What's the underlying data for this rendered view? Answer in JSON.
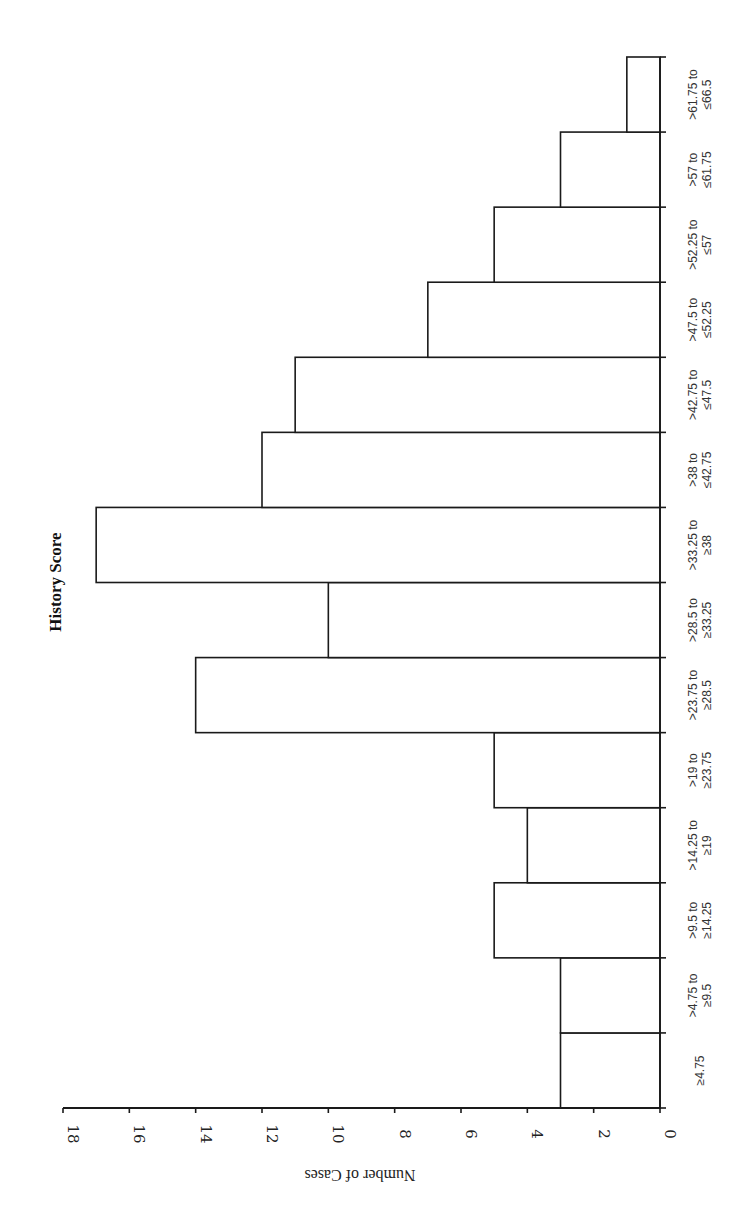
{
  "chart_data": {
    "type": "bar",
    "orientation": "rotated-90-clockwise",
    "title": "History Score",
    "xlabel": "",
    "ylabel": "Number of Cases",
    "ylim": [
      0,
      18
    ],
    "yticks": [
      0,
      2,
      4,
      6,
      8,
      10,
      12,
      14,
      16,
      18
    ],
    "grid": false,
    "legend": null,
    "categories": [
      [
        "≥4.75"
      ],
      [
        ">4.75 to",
        "≥9.5"
      ],
      [
        ">9.5 to",
        "≥14.25"
      ],
      [
        ">14.25 to",
        "≥19"
      ],
      [
        ">19 to",
        "≥23.75"
      ],
      [
        ">23.75 to",
        "≥28.5"
      ],
      [
        ">28.5 to",
        "≥33.25"
      ],
      [
        ">33.25 to",
        "≥38"
      ],
      [
        ">38 to",
        "≤42.75"
      ],
      [
        ">42.75 to",
        "≤47.5"
      ],
      [
        ">47.5 to",
        "≤52.25"
      ],
      [
        ">52.25 to",
        "≤57"
      ],
      [
        ">57 to",
        "≤61.75"
      ],
      [
        ">61.75 to",
        "≤66.5"
      ]
    ],
    "values": [
      3,
      3,
      5,
      4,
      5,
      14,
      10,
      17,
      12,
      11,
      7,
      5,
      3,
      1
    ]
  },
  "labels": {
    "title": "History Score",
    "axis_title": "Number of Cases"
  },
  "colors": {
    "bar_fill": "#ffffff",
    "bar_stroke": "#1a1a1a",
    "text": "#222222"
  }
}
